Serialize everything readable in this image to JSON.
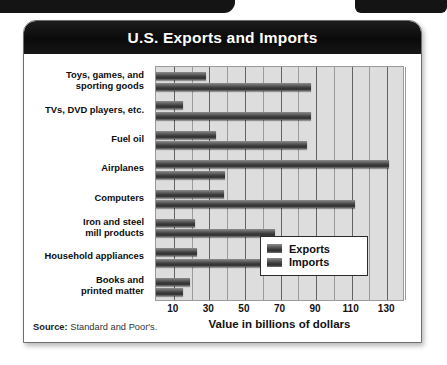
{
  "page": {
    "decor": {
      "top_left_band": "",
      "top_right_band": ""
    }
  },
  "chart_card": {
    "title": "U.S. Exports and Imports",
    "source_label": "Source:",
    "source_value": "Standard and Poor's."
  },
  "legend": {
    "position": "bottom-right",
    "entries": [
      {
        "label": "Exports",
        "color": "#3f3f3f"
      },
      {
        "label": "Imports",
        "color": "#3f3f3f"
      }
    ]
  },
  "chart_data": {
    "type": "bar",
    "orientation": "horizontal",
    "title": "U.S. Exports and Imports",
    "xlabel": "Value in billions of dollars",
    "ylabel": "",
    "xlim": [
      0,
      140
    ],
    "xticks": [
      10,
      30,
      50,
      70,
      90,
      110,
      130
    ],
    "xtick_labels": [
      "10",
      "30",
      "50",
      "70",
      "90",
      "110",
      "130"
    ],
    "minor_gridlines": [
      20,
      40,
      60,
      80,
      100,
      120,
      140
    ],
    "grid": true,
    "legend_position": "bottom-right",
    "categories": [
      "Toys, games, and sporting goods",
      "TVs, DVD players, etc.",
      "Fuel oil",
      "Airplanes",
      "Computers",
      "Iron and steel mill products",
      "Household appliances",
      "Books and printed matter"
    ],
    "category_lines": [
      [
        "Toys, games, and",
        "sporting goods"
      ],
      [
        "TVs, DVD players, etc."
      ],
      [
        "Fuel oil"
      ],
      [
        "Airplanes"
      ],
      [
        "Computers"
      ],
      [
        "Iron and steel",
        "mill products"
      ],
      [
        "Household appliances"
      ],
      [
        "Books and",
        "printed matter"
      ]
    ],
    "series": [
      {
        "name": "Exports",
        "values": [
          28,
          15,
          34,
          131,
          38,
          22,
          23,
          19
        ]
      },
      {
        "name": "Imports",
        "values": [
          87,
          87,
          85,
          39,
          112,
          67,
          60,
          15
        ]
      }
    ]
  }
}
